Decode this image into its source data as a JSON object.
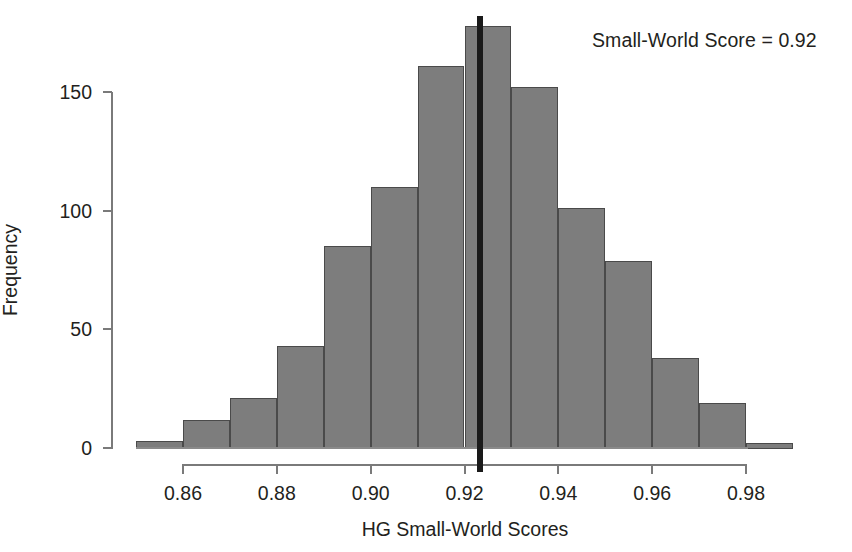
{
  "figure": {
    "annotation": "Small-World Score = 0.92",
    "background_color": "#ffffff",
    "bar_fill_color": "#7d7d7d",
    "bar_border_color": "#4a4a4a",
    "axis_color": "#7a7a7a",
    "text_color": "#231f20",
    "score_line_color": "#1a1a1a"
  },
  "chart_data": {
    "type": "bar",
    "title": "",
    "subtitle": "",
    "xlabel": "HG Small-World Scores",
    "ylabel": "Frequency",
    "xlim": [
      0.85,
      0.99
    ],
    "ylim": [
      0,
      180
    ],
    "grid": false,
    "legend_position": "none",
    "bin_width": 0.01,
    "x_ticks": [
      0.86,
      0.88,
      0.9,
      0.92,
      0.94,
      0.96,
      0.98
    ],
    "x_tick_labels": [
      "0.86",
      "0.88",
      "0.90",
      "0.92",
      "0.94",
      "0.96",
      "0.98"
    ],
    "y_ticks": [
      0,
      50,
      100,
      150
    ],
    "y_tick_labels": [
      "0",
      "50",
      "100",
      "150"
    ],
    "bin_edges": [
      0.85,
      0.86,
      0.87,
      0.88,
      0.89,
      0.9,
      0.91,
      0.92,
      0.93,
      0.94,
      0.95,
      0.96,
      0.97,
      0.98,
      0.99
    ],
    "categories": [
      "0.85-0.86",
      "0.86-0.87",
      "0.87-0.88",
      "0.88-0.89",
      "0.89-0.90",
      "0.90-0.91",
      "0.91-0.92",
      "0.92-0.93",
      "0.93-0.94",
      "0.94-0.95",
      "0.95-0.96",
      "0.96-0.97",
      "0.97-0.98",
      "0.98-0.99"
    ],
    "values": [
      3,
      12,
      21,
      43,
      85,
      110,
      161,
      178,
      152,
      101,
      79,
      38,
      19,
      2
    ],
    "annotations": [
      {
        "text": "Small-World Score = 0.92",
        "x": 0.9233,
        "type": "vertical-reference-line-label"
      }
    ],
    "reference_line": {
      "orientation": "vertical",
      "value": 0.9233,
      "label": "Small-World Score = 0.92",
      "color": "#1a1a1a",
      "width_px": 6
    }
  }
}
